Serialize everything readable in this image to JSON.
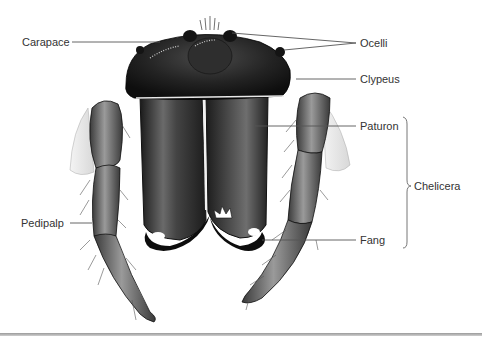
{
  "figure": {
    "labels": {
      "carapace": "Carapace",
      "ocelli": "Ocelli",
      "clypeus": "Clypeus",
      "paturon": "Paturon",
      "chelicera": "Chelicera",
      "pedipalp": "Pedipalp",
      "fang": "Fang"
    },
    "colors": {
      "ink": "#111111",
      "body_dark": "#1e1e1e",
      "paturon_fill": "#3a3a3a",
      "palp_fill": "#6b6b6b",
      "leader_line": "#555555",
      "label_text": "#333333"
    }
  }
}
